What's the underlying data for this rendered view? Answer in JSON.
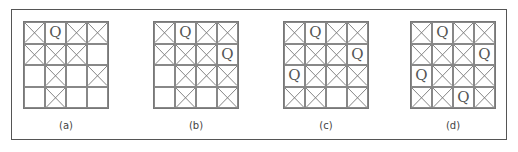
{
  "figure": {
    "panels": [
      {
        "label": "(a)",
        "cells": [
          [
            "X",
            "Q",
            "X",
            "X"
          ],
          [
            "X",
            "X",
            "X",
            ""
          ],
          [
            "",
            "X",
            "",
            "X"
          ],
          [
            "",
            "X",
            "",
            ""
          ]
        ]
      },
      {
        "label": "(b)",
        "cells": [
          [
            "X",
            "Q",
            "X",
            "X"
          ],
          [
            "X",
            "X",
            "X",
            "Q"
          ],
          [
            "",
            "X",
            "X",
            "X"
          ],
          [
            "",
            "X",
            "",
            "X"
          ]
        ]
      },
      {
        "label": "(c)",
        "cells": [
          [
            "X",
            "Q",
            "X",
            "X"
          ],
          [
            "X",
            "X",
            "X",
            "Q"
          ],
          [
            "Q",
            "X",
            "X",
            "X"
          ],
          [
            "X",
            "X",
            "",
            "X"
          ]
        ]
      },
      {
        "label": "(d)",
        "cells": [
          [
            "X",
            "Q",
            "X",
            "X"
          ],
          [
            "X",
            "X",
            "X",
            "Q"
          ],
          [
            "Q",
            "X",
            "X",
            "X"
          ],
          [
            "X",
            "X",
            "Q",
            "X"
          ]
        ]
      }
    ],
    "colors": {
      "grid_line": "#888888",
      "cross_line": "#777777",
      "frame": "#555555",
      "text": "#555555"
    }
  }
}
